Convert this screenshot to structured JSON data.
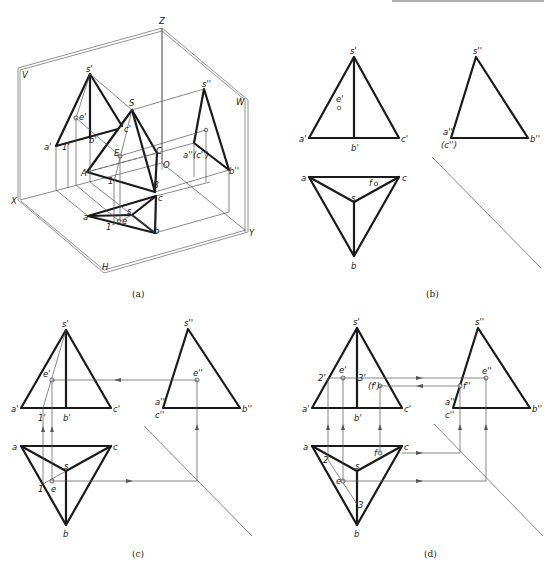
{
  "figure": {
    "panels": [
      {
        "id": "a",
        "caption": "(a)",
        "type": "pictorial-3d",
        "planes": {
          "V": "V",
          "W": "W",
          "H": "H"
        },
        "axes": {
          "X": "X",
          "Y": "Y",
          "Z": "Z",
          "O": "O"
        },
        "labels": {
          "S": "S",
          "A": "A",
          "B": "B",
          "C": "C",
          "E": "E",
          "s1": "s'",
          "a1": "a'",
          "b1": "b'",
          "c1": "c'",
          "e1": "e'",
          "one1": "1'",
          "s2": "s''",
          "a2c2": "a''(c'')",
          "b2": "b''",
          "e2": "e''",
          "s": "s",
          "a": "a",
          "b": "b",
          "c": "c",
          "e": "e",
          "one": "1",
          "oneUpper": "1"
        }
      },
      {
        "id": "b",
        "caption": "(b)",
        "type": "three-view",
        "front": {
          "s": "s'",
          "a": "a'",
          "b": "b'",
          "c": "c'",
          "e": "e'"
        },
        "side": {
          "s": "s''",
          "a": "a''",
          "c": "(c'')",
          "b": "b''"
        },
        "top": {
          "a": "a",
          "b": "b",
          "c": "c",
          "s": "s",
          "f": "f"
        }
      },
      {
        "id": "c",
        "caption": "(c)",
        "type": "three-view-construction",
        "front": {
          "s": "s'",
          "a": "a'",
          "b": "b'",
          "c": "c'",
          "e": "e'",
          "one": "1'"
        },
        "side": {
          "s": "s''",
          "a": "a''",
          "c": "c''",
          "b": "b''",
          "e": "e''"
        },
        "top": {
          "a": "a",
          "b": "b",
          "c": "c",
          "s": "s",
          "e": "e",
          "one": "1"
        }
      },
      {
        "id": "d",
        "caption": "(d)",
        "type": "three-view-construction",
        "front": {
          "s": "s'",
          "a": "a'",
          "b": "b'",
          "c": "c'",
          "e": "e'",
          "two": "2'",
          "three": "3'",
          "f": "(f')"
        },
        "side": {
          "s": "s''",
          "a": "a''",
          "c": "c''",
          "b": "b''",
          "e": "e''",
          "f": "f''"
        },
        "top": {
          "a": "a",
          "b": "b",
          "c": "c",
          "s": "s",
          "e": "e",
          "f": "f",
          "two": "2",
          "three": "3"
        }
      }
    ]
  }
}
